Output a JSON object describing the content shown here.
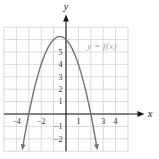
{
  "chart_data": {
    "type": "line",
    "title": "",
    "curve_label": "y = f(x)",
    "xlabel": "x",
    "ylabel": "y",
    "grid": true,
    "x_range": [
      -5,
      5
    ],
    "y_range": [
      -3,
      7
    ],
    "x_tick_values": [
      -4,
      -2,
      1,
      3,
      4
    ],
    "x_tick_labels": [
      "−4",
      "−2",
      "1",
      "3",
      "4"
    ],
    "y_tick_values": [
      5,
      4,
      3,
      2,
      1,
      -1,
      -2
    ],
    "y_tick_labels": [
      "5",
      "4",
      "3",
      "2",
      "1",
      "−1",
      "−2"
    ],
    "curve": {
      "kind": "quadratic",
      "a": -1,
      "b": -1,
      "c": 6,
      "domain": [
        -3.47,
        2.47
      ],
      "vertex": [
        -0.5,
        6.25
      ],
      "x_intercepts": [
        -3,
        2
      ],
      "y_intercept": 6,
      "end_arrows": true
    },
    "colors": {
      "curve": "#747474",
      "grid": "#c9cdd2",
      "axis": "#1c1c1c",
      "tick_text": "#333333",
      "curve_label": "#9b9b9b"
    }
  }
}
